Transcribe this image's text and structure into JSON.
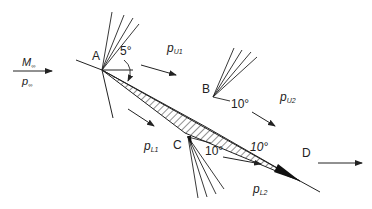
{
  "freestream": {
    "mach_label": "M",
    "mach_sub": "∞",
    "pressure_label": "p",
    "pressure_sub": "∞"
  },
  "points": {
    "A": "A",
    "B": "B",
    "C": "C",
    "D": "D"
  },
  "angles": {
    "leading_edge": "5°",
    "upper_B": "10°",
    "lower_C": "10°",
    "trailing_D": "10°"
  },
  "pressures": {
    "pU1": {
      "base": "p",
      "sub": "U1"
    },
    "pU2": {
      "base": "p",
      "sub": "U2"
    },
    "pL1": {
      "base": "p",
      "sub": "L1"
    },
    "pL2": {
      "base": "p",
      "sub": "L2"
    }
  },
  "colors": {
    "ink": "#222222",
    "background": "#ffffff"
  }
}
